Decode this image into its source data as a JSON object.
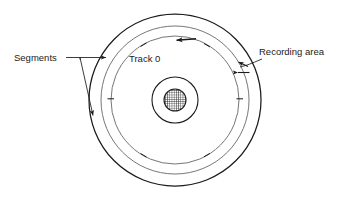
{
  "figure": {
    "labels": {
      "segments": "Segments",
      "track0": "Track 0",
      "recording_area": "Recording area"
    },
    "colors": {
      "stroke": "#1a1a1a",
      "stroke_light": "#555555",
      "background": "#ffffff",
      "hub_fill": "#1a1a1a"
    },
    "geometry": {
      "center_x": 175,
      "center_y": 100,
      "outer_disk_radius": 86,
      "recording_outer_radius": 74,
      "track0_radius": 64,
      "hub_outer_radius": 23,
      "spindle_hole_radius": 11
    },
    "annotations": {
      "segments_targets": 2,
      "recording_area_arrow_style": "double-headed",
      "track_direction_arrow": "counterclockwise",
      "tick_marks": 6
    }
  }
}
